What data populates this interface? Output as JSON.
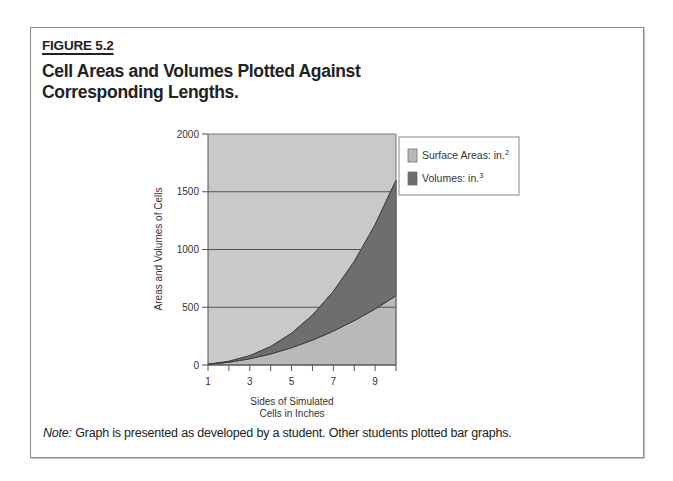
{
  "figure": {
    "label": "FIGURE 5.2",
    "title": "Cell Areas and Volumes Plotted Against Corresponding Lengths.",
    "note_prefix": "Note:",
    "note_text": " Graph is presented as developed by a student. Other students plotted bar graphs."
  },
  "colors": {
    "plot_background": "#c9c9c9",
    "surface_area_fill": "#b9b9b9",
    "volume_fill": "#6e6e6e",
    "gridline": "#555555",
    "frame_border": "#8a8a8a"
  },
  "chart_data": {
    "type": "area",
    "stacked": true,
    "title": "",
    "xlabel": "Sides of Simulated Cells in Inches",
    "xlabel_lines": [
      "Sides of Simulated",
      "Cells in Inches"
    ],
    "ylabel": "Areas and Volumes of Cells",
    "x": [
      1,
      2,
      3,
      4,
      5,
      6,
      7,
      8,
      9,
      10
    ],
    "x_tick_labels": [
      "1",
      "3",
      "5",
      "7",
      "9"
    ],
    "x_tick_label_values": [
      1,
      3,
      5,
      7,
      9
    ],
    "xlim": [
      1,
      10
    ],
    "ylim": [
      0,
      2000
    ],
    "y_ticks": [
      0,
      500,
      1000,
      1500,
      2000
    ],
    "y_tick_labels": [
      "0",
      "500",
      "1000",
      "1500",
      "2000"
    ],
    "grid": true,
    "legend_position": "right-top",
    "series": [
      {
        "name": "Surface Areas: in.",
        "superscript": "2",
        "values": [
          6,
          24,
          54,
          96,
          150,
          216,
          294,
          384,
          486,
          600
        ]
      },
      {
        "name": "Volumes: in.",
        "superscript": "3",
        "values": [
          1,
          8,
          27,
          64,
          125,
          216,
          343,
          512,
          729,
          1000
        ]
      }
    ]
  }
}
